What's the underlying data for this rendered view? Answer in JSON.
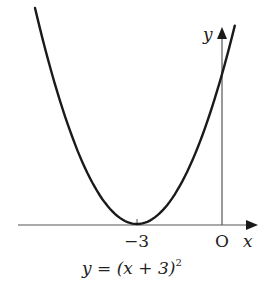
{
  "diagram": {
    "equation_label": {
      "prefix": "y = (x + 3)",
      "exponent": "2"
    },
    "axes": {
      "x_label": "x",
      "y_label": "y",
      "origin_label": "O"
    },
    "tick_labels": {
      "vertex_x": "−3"
    },
    "colors": {
      "curve": "#1a1a1a",
      "axis": "#555555",
      "text": "#222222"
    }
  },
  "chart_data": {
    "type": "line",
    "xlabel": "x",
    "ylabel": "y",
    "series": [
      {
        "name": "y = (x + 3)^2",
        "x": [
          -6.6,
          -6,
          -5,
          -4,
          -3,
          -2,
          -1,
          0,
          0.45
        ],
        "y": [
          12.96,
          9,
          4,
          1,
          0,
          1,
          4,
          9,
          11.9
        ]
      }
    ],
    "annotations": [
      {
        "text": "−3",
        "x": -3,
        "y": 0,
        "note": "vertex on x-axis"
      },
      {
        "text": "O",
        "x": 0,
        "y": 0,
        "note": "origin"
      }
    ],
    "grid": false,
    "legend": "none"
  }
}
